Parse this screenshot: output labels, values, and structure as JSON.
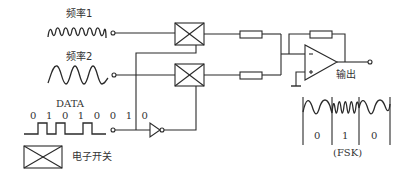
{
  "diagram": {
    "inputs": {
      "freq1": {
        "label": "频率1"
      },
      "freq2": {
        "label": "频率2"
      },
      "data": {
        "label": "DATA",
        "bits": "0 1 0 1 0 0 1 0"
      }
    },
    "output": {
      "label": "输出"
    },
    "fsk": {
      "caption": "(FSK)",
      "bit_labels": [
        "0",
        "1",
        "0"
      ]
    },
    "legend": {
      "label": "电子开关"
    },
    "colors": {
      "stroke": "#2a2a2a",
      "background": "#ffffff"
    }
  }
}
